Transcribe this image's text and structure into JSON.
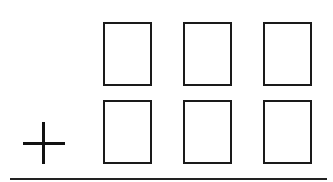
{
  "problem": {
    "type": "vertical-addition",
    "operator": "+",
    "operator_name": "plus",
    "rows": [
      {
        "digits": [
          "",
          "",
          ""
        ]
      },
      {
        "digits": [
          "",
          "",
          ""
        ]
      }
    ],
    "columns": 3
  },
  "colors": {
    "stroke": "#1a1a1a",
    "background": "#ffffff"
  }
}
